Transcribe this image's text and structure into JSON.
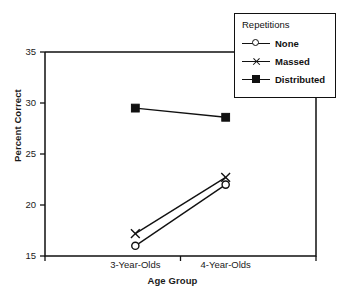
{
  "chart_data": {
    "type": "line",
    "title": "",
    "xlabel": "Age Group",
    "ylabel": "Percent Correct",
    "categories": [
      "3-Year-Olds",
      "4-Year-Olds"
    ],
    "ylim": [
      15,
      35
    ],
    "yticks": [
      15,
      20,
      25,
      30,
      35
    ],
    "ytick_labels": [
      "15",
      "20",
      "25",
      "30",
      "35"
    ],
    "grid": false,
    "legend_position": "top-right",
    "legend_title": "Repetitions",
    "series": [
      {
        "name": "None",
        "marker": "open-circle",
        "values": [
          16.0,
          22.0
        ]
      },
      {
        "name": "Massed",
        "marker": "x",
        "values": [
          17.2,
          22.7
        ]
      },
      {
        "name": "Distributed",
        "marker": "filled-square",
        "values": [
          29.5,
          28.6
        ]
      }
    ],
    "colors": {
      "ink": "#111111",
      "background": "#ffffff"
    }
  },
  "caption": ""
}
